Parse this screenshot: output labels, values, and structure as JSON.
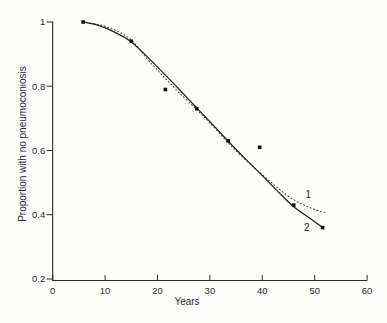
{
  "figure": {
    "background_color": "#fdfdfb",
    "ink_color": "#2b2b2b",
    "curve_solid_color": "#222222",
    "curve_dotted_color": "#3d3d3d",
    "marker_color": "#111111"
  },
  "chart_data": {
    "type": "line",
    "title": "",
    "xlabel": "Years",
    "ylabel": "Proportion with no pneumoconiosis",
    "xlim": [
      0,
      60
    ],
    "ylim": [
      0.2,
      1.0
    ],
    "grid": false,
    "x_ticks": [
      {
        "value": 0,
        "label": "0"
      },
      {
        "value": 10,
        "label": "10"
      },
      {
        "value": 20,
        "label": "20"
      },
      {
        "value": 30,
        "label": "30"
      },
      {
        "value": 40,
        "label": "40"
      },
      {
        "value": 50,
        "label": "50"
      },
      {
        "value": 60,
        "label": "60"
      }
    ],
    "y_ticks": [
      {
        "value": 1.0,
        "label": "1"
      },
      {
        "value": 0.8,
        "label": "0.8"
      },
      {
        "value": 0.6,
        "label": "0.6"
      },
      {
        "value": 0.4,
        "label": "0.4"
      },
      {
        "value": 0.2,
        "label": "0.2"
      }
    ],
    "observed_points": {
      "marker": "filled-square",
      "data": [
        [
          5.8,
          1.0
        ],
        [
          15.0,
          0.94
        ],
        [
          21.5,
          0.79
        ],
        [
          27.5,
          0.73
        ],
        [
          33.5,
          0.63
        ],
        [
          39.5,
          0.61
        ],
        [
          46.0,
          0.43
        ],
        [
          51.5,
          0.36
        ]
      ]
    },
    "series": [
      {
        "name": "1",
        "style": "dotted",
        "label_at": [
          48.8,
          0.462
        ],
        "points": [
          [
            5.8,
            1.0
          ],
          [
            9,
            0.991
          ],
          [
            12,
            0.974
          ],
          [
            15,
            0.944
          ],
          [
            18,
            0.886
          ],
          [
            21,
            0.833
          ],
          [
            24,
            0.782
          ],
          [
            27.5,
            0.727
          ],
          [
            30,
            0.686
          ],
          [
            33.5,
            0.624
          ],
          [
            37,
            0.568
          ],
          [
            40,
            0.525
          ],
          [
            43,
            0.483
          ],
          [
            46,
            0.447
          ],
          [
            49,
            0.423
          ],
          [
            51.9,
            0.406
          ]
        ]
      },
      {
        "name": "2",
        "style": "solid",
        "label_at": [
          48.5,
          0.362
        ],
        "points": [
          [
            5.8,
            1.0
          ],
          [
            9,
            0.988
          ],
          [
            12,
            0.967
          ],
          [
            15,
            0.938
          ],
          [
            18,
            0.893
          ],
          [
            21,
            0.843
          ],
          [
            24,
            0.792
          ],
          [
            27,
            0.741
          ],
          [
            30,
            0.69
          ],
          [
            33.5,
            0.629
          ],
          [
            37,
            0.57
          ],
          [
            40,
            0.522
          ],
          [
            43,
            0.472
          ],
          [
            46,
            0.425
          ],
          [
            49,
            0.39
          ],
          [
            51.5,
            0.36
          ]
        ]
      }
    ]
  }
}
